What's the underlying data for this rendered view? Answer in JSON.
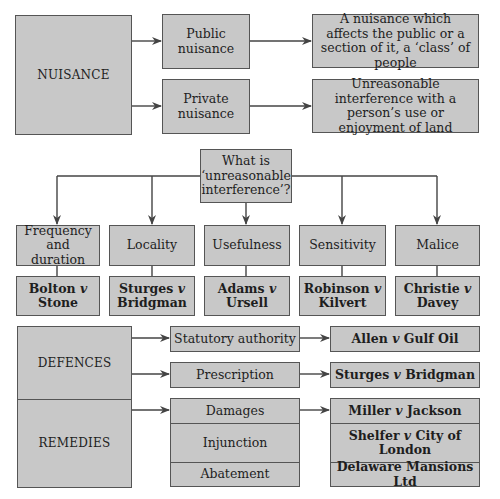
{
  "top": {
    "root": "NUISANCE",
    "branches": [
      {
        "label": "Public nuisance",
        "definition": "A nuisance which affects the public or a section of it, a ‘class’ of people"
      },
      {
        "label": "Private nuisance",
        "definition": "Unreasonable interference with a person’s use or enjoyment of land"
      }
    ]
  },
  "middle": {
    "question": "What is ‘unreasonable interference’?",
    "factors": [
      {
        "label": "Frequency and duration",
        "case_a": "Bolton",
        "case_v": "v",
        "case_b": "Stone"
      },
      {
        "label": "Locality",
        "case_a": "Sturges",
        "case_v": "v",
        "case_b": "Bridgman"
      },
      {
        "label": "Usefulness",
        "case_a": "Adams",
        "case_v": "v",
        "case_b": "Ursell"
      },
      {
        "label": "Sensitivity",
        "case_a": "Robinson",
        "case_v": "v",
        "case_b": "Kilvert"
      },
      {
        "label": "Malice",
        "case_a": "Christie",
        "case_v": "v",
        "case_b": "Davey"
      }
    ]
  },
  "bottom": {
    "defences_label": "DEFENCES",
    "remedies_label": "REMEDIES",
    "defences": [
      {
        "label": "Statutory authority",
        "case_a": "Allen",
        "case_v": "v",
        "case_b": "Gulf Oil"
      },
      {
        "label": "Prescription",
        "case_a": "Sturges",
        "case_v": "v",
        "case_b": "Bridgman"
      }
    ],
    "remedies": [
      {
        "label": "Damages",
        "case_a": "Miller",
        "case_v": "v",
        "case_b": "Jackson"
      },
      {
        "label": "Injunction",
        "case_a": "Shelfer",
        "case_v": "v",
        "case_b": "City of London"
      },
      {
        "label": "Abatement",
        "case_full": "Delaware Mansions Ltd"
      }
    ]
  },
  "colors": {
    "box_fill": "#c8c8c8",
    "border": "#555555",
    "arrow": "#444444"
  }
}
